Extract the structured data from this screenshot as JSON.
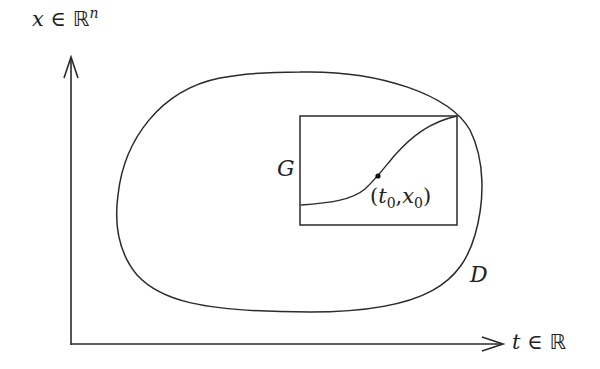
{
  "diagram": {
    "axes": {
      "x_label_var": "t",
      "x_label_rel": "∈",
      "x_label_set": "ℝ",
      "y_label_var": "x",
      "y_label_rel": "∈",
      "y_label_set": "ℝ",
      "y_label_exp": "n"
    },
    "region_label": "D",
    "box_label": "G",
    "point_label": {
      "open": "(",
      "t": "t",
      "t_sub": "0",
      "comma": ",",
      "x": "x",
      "x_sub": "0",
      "close": ")"
    },
    "colors": {
      "stroke": "#2a2a2a",
      "background": "#ffffff"
    }
  }
}
